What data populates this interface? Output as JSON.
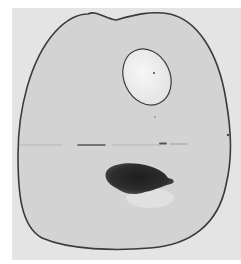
{
  "image": {
    "kind": "grayscale photograph",
    "subject": "specimen slice with oval inclusion, horizontal line, and dark spot",
    "colors": {
      "background": "#e4e4e4",
      "specimen_fill": "#d2d2d2",
      "outline": "#3a3a3a",
      "oval_fill": "#f0f0f0",
      "dark_spot": "#2a2a2a",
      "faint_halo": "#e6e6e6"
    }
  }
}
